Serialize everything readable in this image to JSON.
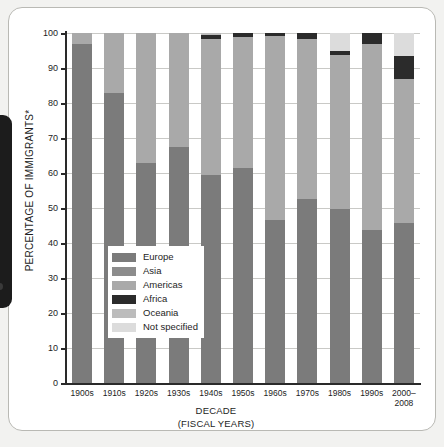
{
  "figure": {
    "y_axis_title": "PERCENTAGE OF IMMIGRANTS*",
    "x_axis_title_line1": "DECADE",
    "x_axis_title_line2": "(FISCAL YEARS)"
  },
  "colors": {
    "europe": "#7b7b7b",
    "asia": "#8c8c8c",
    "americas": "#a9a9a9",
    "africa": "#2b2b2b",
    "oceania": "#bcbcbc",
    "not_specified": "#dcdcdc",
    "axis": "#2a2a2a",
    "grid": "#c9c9c6",
    "card_border": "#b9b9b4",
    "page_backdrop": "#f2f2f0",
    "gutter_slab": "#1c1c1c"
  },
  "legend": {
    "items": [
      {
        "label": "Europe",
        "color": "#7b7b7b"
      },
      {
        "label": "Asia",
        "color": "#8c8c8c"
      },
      {
        "label": "Americas",
        "color": "#a9a9a9"
      },
      {
        "label": "Africa",
        "color": "#2b2b2b"
      },
      {
        "label": "Oceania",
        "color": "#bcbcbc"
      },
      {
        "label": "Not specified",
        "color": "#dcdcdc"
      }
    ]
  },
  "chart_data": {
    "type": "bar",
    "stacked": true,
    "title": "",
    "xlabel": "DECADE (FISCAL YEARS)",
    "ylabel": "PERCENTAGE OF IMMIGRANTS*",
    "ylim": [
      0,
      100
    ],
    "yticks": [
      0,
      10,
      20,
      30,
      40,
      50,
      60,
      70,
      80,
      90,
      100
    ],
    "grid": true,
    "legend_position": "inside-left-lower",
    "categories": [
      "1900s",
      "1910s",
      "1920s",
      "1930s",
      "1940s",
      "1950s",
      "1960s",
      "1970s",
      "1980s",
      "1990s",
      "2000–2008"
    ],
    "series": [
      {
        "name": "Europe",
        "color": "#7b7b7b",
        "values": [
          97.0,
          83.0,
          63.0,
          67.3,
          59.4,
          61.5,
          46.5,
          52.7,
          49.7,
          43.7,
          45.8
        ]
      },
      {
        "name": "Asia",
        "color": "#8c8c8c",
        "values": [
          0.0,
          0.0,
          0.0,
          0.0,
          0.0,
          0.0,
          0.0,
          0.0,
          0.0,
          0.0,
          0.0
        ]
      },
      {
        "name": "Americas",
        "color": "#a9a9a9",
        "values": [
          3.0,
          17.0,
          37.0,
          32.7,
          38.8,
          37.6,
          52.6,
          45.7,
          43.9,
          53.3,
          41.2
        ]
      },
      {
        "name": "Africa",
        "color": "#2b2b2b",
        "values": [
          0.0,
          0.0,
          0.0,
          0.0,
          1.2,
          1.0,
          0.9,
          1.6,
          1.2,
          3.0,
          6.5
        ]
      },
      {
        "name": "Oceania",
        "color": "#bcbcbc",
        "values": [
          0.0,
          0.0,
          0.0,
          0.0,
          0.6,
          0.0,
          0.0,
          0.0,
          0.0,
          0.0,
          0.0
        ]
      },
      {
        "name": "Not specified",
        "color": "#dcdcdc",
        "values": [
          0.0,
          0.0,
          0.0,
          0.0,
          0.0,
          0.0,
          0.0,
          0.0,
          5.2,
          0.0,
          6.5
        ]
      }
    ],
    "bars": [
      {
        "category": "1900s",
        "segments": [
          {
            "name": "Europe",
            "from": 0.0,
            "to": 97.0
          },
          {
            "name": "Americas",
            "from": 97.0,
            "to": 100.0
          }
        ]
      },
      {
        "category": "1910s",
        "segments": [
          {
            "name": "Europe",
            "from": 0.0,
            "to": 83.0
          },
          {
            "name": "Americas",
            "from": 83.0,
            "to": 100.0
          }
        ]
      },
      {
        "category": "1920s",
        "segments": [
          {
            "name": "Europe",
            "from": 0.0,
            "to": 63.0
          },
          {
            "name": "Americas",
            "from": 63.0,
            "to": 100.0
          }
        ]
      },
      {
        "category": "1930s",
        "segments": [
          {
            "name": "Europe",
            "from": 0.0,
            "to": 67.3
          },
          {
            "name": "Americas",
            "from": 67.3,
            "to": 100.0
          }
        ]
      },
      {
        "category": "1940s",
        "segments": [
          {
            "name": "Europe",
            "from": 0.0,
            "to": 59.4
          },
          {
            "name": "Americas",
            "from": 59.4,
            "to": 98.2
          },
          {
            "name": "Africa",
            "from": 98.2,
            "to": 99.4
          },
          {
            "name": "Oceania",
            "from": 99.4,
            "to": 100.0
          }
        ]
      },
      {
        "category": "1950s",
        "segments": [
          {
            "name": "Europe",
            "from": 0.0,
            "to": 61.5
          },
          {
            "name": "Americas",
            "from": 61.5,
            "to": 99.0
          },
          {
            "name": "Africa",
            "from": 99.0,
            "to": 100.0
          }
        ]
      },
      {
        "category": "1960s",
        "segments": [
          {
            "name": "Europe",
            "from": 0.0,
            "to": 46.5
          },
          {
            "name": "Americas",
            "from": 46.5,
            "to": 99.1
          },
          {
            "name": "Africa",
            "from": 99.1,
            "to": 100.0
          }
        ]
      },
      {
        "category": "1970s",
        "segments": [
          {
            "name": "Europe",
            "from": 0.0,
            "to": 52.7
          },
          {
            "name": "Americas",
            "from": 52.7,
            "to": 98.4
          },
          {
            "name": "Africa",
            "from": 98.4,
            "to": 100.0
          }
        ]
      },
      {
        "category": "1980s",
        "segments": [
          {
            "name": "Europe",
            "from": 0.0,
            "to": 49.7
          },
          {
            "name": "Americas",
            "from": 49.7,
            "to": 93.6
          },
          {
            "name": "Africa",
            "from": 93.6,
            "to": 94.8
          },
          {
            "name": "Not specified",
            "from": 94.8,
            "to": 100.0
          }
        ]
      },
      {
        "category": "1990s",
        "segments": [
          {
            "name": "Europe",
            "from": 0.0,
            "to": 43.7
          },
          {
            "name": "Americas",
            "from": 43.7,
            "to": 97.0
          },
          {
            "name": "Africa",
            "from": 97.0,
            "to": 100.0
          }
        ]
      },
      {
        "category": "2000–2008",
        "segments": [
          {
            "name": "Europe",
            "from": 0.0,
            "to": 45.8
          },
          {
            "name": "Americas",
            "from": 45.8,
            "to": 87.0
          },
          {
            "name": "Africa",
            "from": 87.0,
            "to": 93.5
          },
          {
            "name": "Not specified",
            "from": 93.5,
            "to": 100.0
          }
        ]
      }
    ]
  }
}
